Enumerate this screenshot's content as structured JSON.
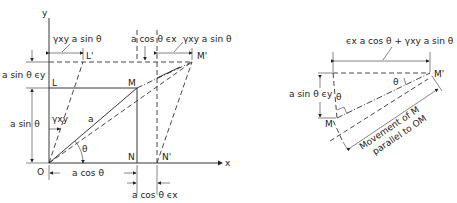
{
  "figure": {
    "left": {
      "axes": {
        "x_label": "x",
        "y_label": "y",
        "origin_label": "O"
      },
      "points": {
        "L": "L",
        "L_prime": "L'",
        "M": "M",
        "M_prime": "M'",
        "N": "N",
        "N_prime": "N'"
      },
      "labels": {
        "shear_top": "γxy  a sin θ",
        "top_middle": "a cos θ ϵx",
        "shear_top_right": "γxy a sin θ",
        "left_upper": "a sin θ ϵy",
        "left_lower": "a sin θ",
        "gamma_xy": "γxy",
        "radius": "a",
        "angle": "θ",
        "bottom_base": "a cos θ",
        "bottom_strain": "a cos θ ϵx"
      }
    },
    "right": {
      "points": {
        "M": "M",
        "M_prime": "M'"
      },
      "labels": {
        "top_total": "ϵx a cos θ + γxy a sin θ",
        "left_strain": "a sin θ ϵy",
        "angle_upper": "θ",
        "angle_lower": "θ",
        "movement_line1": "Movement of M",
        "movement_line2": "parallel to OM"
      }
    }
  }
}
